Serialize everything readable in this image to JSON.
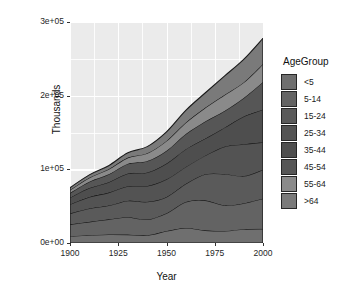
{
  "chart_data": {
    "type": "area",
    "title": "",
    "xlabel": "Year",
    "ylabel": "Thousands",
    "xlim": [
      1900,
      2000
    ],
    "ylim": [
      0,
      300000
    ],
    "grid": true,
    "stacked": true,
    "legend_title": "AgeGroup",
    "legend_position": "right",
    "x_ticks": [
      "1900",
      "1925",
      "1950",
      "1975",
      "2000"
    ],
    "x_tick_values": [
      1900,
      1925,
      1950,
      1975,
      2000
    ],
    "y_ticks": [
      "0e+00",
      "1e+05",
      "2e+05",
      "3e+05"
    ],
    "y_tick_values": [
      0,
      100000,
      200000,
      300000
    ],
    "x": [
      1900,
      1910,
      1920,
      1930,
      1940,
      1950,
      1960,
      1970,
      1980,
      1990,
      2000
    ],
    "series": [
      {
        "name": "<5",
        "color": "#6f6f6f",
        "values": [
          9200,
          10600,
          11600,
          11400,
          10600,
          16200,
          20300,
          17200,
          16300,
          18800,
          19200
        ]
      },
      {
        "name": "5-14",
        "color": "#636363",
        "values": [
          16100,
          18100,
          20500,
          23600,
          21400,
          24300,
          35500,
          40700,
          34900,
          35100,
          41100
        ]
      },
      {
        "name": "15-24",
        "color": "#5a5a5a",
        "values": [
          14900,
          18100,
          18700,
          22400,
          24000,
          22100,
          24600,
          35400,
          42500,
          37000,
          39200
        ]
      },
      {
        "name": "25-34",
        "color": "#535353",
        "values": [
          12300,
          15700,
          17600,
          19600,
          21400,
          23800,
          22900,
          25300,
          37100,
          43200,
          37200
        ]
      },
      {
        "name": "35-44",
        "color": "#4e4e4e",
        "values": [
          9100,
          12100,
          14200,
          17400,
          18300,
          21500,
          24100,
          23100,
          25800,
          37600,
          44500
        ]
      },
      {
        "name": "45-54",
        "color": "#565656",
        "values": [
          6400,
          8600,
          10600,
          13100,
          15500,
          17300,
          20500,
          23200,
          22700,
          25200,
          37400
        ]
      },
      {
        "name": "55-64",
        "color": "#8a8a8a",
        "values": [
          4000,
          5400,
          6900,
          8400,
          10600,
          13400,
          15600,
          18600,
          21700,
          21100,
          24300
        ]
      },
      {
        "name": ">64",
        "color": "#7a7a7a",
        "values": [
          3100,
          3900,
          4900,
          6600,
          9000,
          12300,
          16600,
          20100,
          25500,
          31200,
          35000
        ]
      }
    ],
    "legend_entries": [
      {
        "label": "<5",
        "color": "#6f6f6f"
      },
      {
        "label": "5-14",
        "color": "#636363"
      },
      {
        "label": "15-24",
        "color": "#5a5a5a"
      },
      {
        "label": "25-34",
        "color": "#535353"
      },
      {
        "label": "35-44",
        "color": "#4e4e4e"
      },
      {
        "label": "45-54",
        "color": "#565656"
      },
      {
        "label": "55-64",
        "color": "#8a8a8a"
      },
      {
        "label": ">64",
        "color": "#7a7a7a"
      }
    ],
    "panel_background": "#ebebeb",
    "gridline_color": "#ffffff",
    "area_outline_color": "#1a1a1a"
  }
}
